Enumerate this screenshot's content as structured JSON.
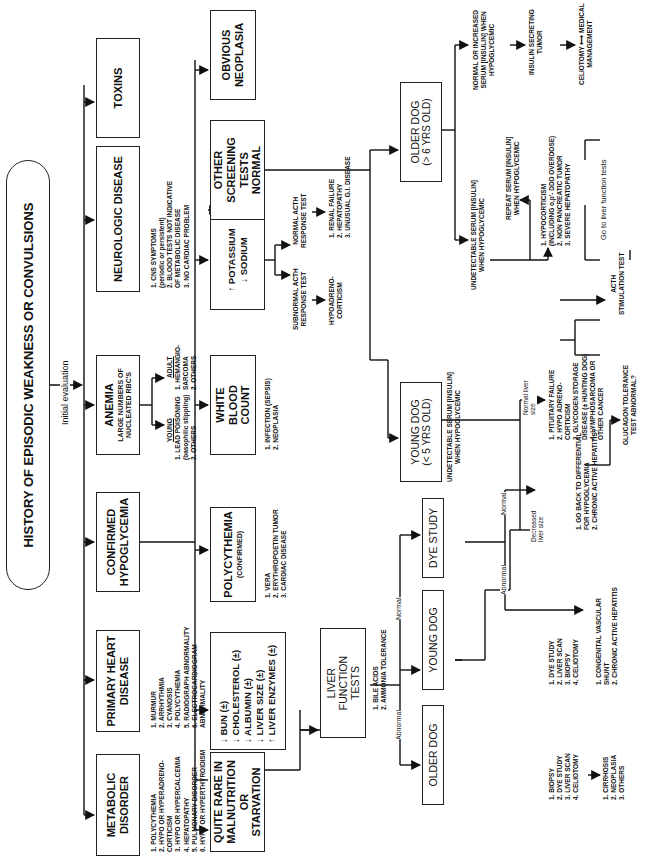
{
  "title": "HISTORY OF EPISODIC WEAKNESS OR CONVULSIONS",
  "initial_label": "Initial  evaluation",
  "row1": {
    "metabolic": {
      "label": "METABOLIC DISORDER",
      "items": [
        "1.  POLYCYTHEMIA",
        "2.  HYPO OR HYPERADRENO-",
        "     CORTICISM",
        "3.  HYPO OR HYPERCALCEMIA",
        "4.  HEPATOPATHY",
        "5.  PULMONARY DISORDER",
        "6.  HYPO OR HYPERTHYROIDISM"
      ]
    },
    "heart": {
      "label": "PRIMARY HEART DISEASE",
      "items": [
        "1.  MURMUR",
        "2.  ARRHYTHMIA",
        "3.  CYANOSIS",
        "4.  POLYCYTHEMIA",
        "5.  RADIOGRAPH ABNORMALITY",
        "6.  ELECTROCARDIOGRAM",
        "     ABNORMALITY"
      ]
    },
    "hypoglycemia": {
      "label": "CONFIRMED HYPOGLYCEMIA"
    },
    "anemia": {
      "label": "ANEMIA",
      "sub": "LARGE NUMBERS OF NUCLEATED RBC'S",
      "young": {
        "heading": "YOUNG",
        "items": [
          "1.  LEAD POISONING",
          "     (basophilic stippling)",
          "2.  OTHERS"
        ]
      },
      "adult": {
        "heading": "ADULT",
        "items": [
          "1.  HEMANGIO-",
          "     SARCOMA",
          "2.  OTHERS"
        ]
      }
    },
    "neurologic": {
      "label": "NEUROLOGIC DISEASE",
      "items": [
        "1.  CNS SYMPTOMS",
        "     (periodic or persistent)",
        "2.  BLOOD TESTS NOT INDICATIVE",
        "     OF METABOLIC DISEASE",
        "3.  NO CARDIAC PROBLEM"
      ],
      "causes": [
        "1.  PRIMARY CNS DISEASE",
        "2.  TRAUMA",
        "3.  NEUROMUSCULAR DISEASE",
        "     (numerous causes)"
      ]
    },
    "toxins": {
      "label": "TOXINS"
    }
  },
  "row2": {
    "starvation": {
      "label": "QUITE RARE IN MALNUTRITION OR STARVATION"
    },
    "liver_signs": {
      "items": [
        "↓  BUN (±)",
        "↓  CHOLESTEROL (±)",
        "↓  ALBUMIN (±)",
        "↓  LIVER SIZE (±)",
        "↑  LIVER ENZYMES (±)"
      ]
    },
    "polycythemia": {
      "label": "POLYCYTHEMIA",
      "sub": "(CONFIRMED)",
      "items": [
        "1.  VERA",
        "2.  ERYTHROPOETIN  TUMOR",
        "3.  CARDIAC DISEASE"
      ]
    },
    "wbc": {
      "label": "WHITE BLOOD COUNT",
      "items": [
        "1.  INFECTION (SEPSIS)",
        "2.  NEOPLASIA"
      ]
    },
    "electrolytes": {
      "label_lines": [
        "↑  POTASSIUM",
        "↓  SODIUM"
      ],
      "subnormal": [
        "SUBNORMAL  ACTH",
        "RESPONSE  TEST"
      ],
      "subnormal_result": [
        "HYPOADRENO-",
        "CORTICISM"
      ],
      "normal": [
        "NORMAL  ACTH",
        "RESPONSE  TEST"
      ],
      "normal_result": [
        "1.  RENAL FAILURE",
        "2.  HEPATOPATHY",
        "3.  UNUSUAL G.I. DISEASE"
      ]
    },
    "screening": {
      "label": "OTHER SCREENING TESTS NORMAL"
    },
    "neoplasia": {
      "label": "OBVIOUS NEOPLASIA"
    }
  },
  "hypoglycemia_branch": {
    "young_dog": {
      "label": "YOUNG DOG",
      "sub": "(< 5 YRS OLD)"
    },
    "older_dog": {
      "label": "OLDER DOG",
      "sub": "(> 6 YRS OLD)"
    },
    "young_undetectable": [
      "UNDETECTABLE  SERUM  [INSULIN]",
      "WHEN HYPOGLYCEMIC"
    ],
    "decreased_liver": [
      "Decreased",
      "liver size"
    ],
    "normal_liver": [
      "Normal liver",
      "size"
    ],
    "normal_liver_items": [
      "1.  PITUITARY FAILURE",
      "2.  HYPO ADRENO-",
      "     CORTICISM",
      "3.  GLYCOGEN  STORAGE",
      "     DISEASE (± HUNTING DOG)",
      "4.  LYMPHOSARCOMA OR",
      "     OTHER CANCER"
    ],
    "acth_test": [
      "ACTH",
      "STIMULATION  TEST"
    ],
    "glucagon_test": [
      "GLUCAGON  TOLERANCE",
      "TEST  ABNORMAL?"
    ],
    "older_undetectable": [
      "UNDETECTABLE SERUM [INSULIN]",
      "WHEN HYPOGLYCEMIC"
    ],
    "older_undetectable_items": [
      "1.  HYPOCORTICISM",
      "     (INCLUDING o,p'- DDD OVERDOSE)",
      "2.  NON PANCREATIC  TUMOR",
      "3.  SEVERE  HEPATOPATHY"
    ],
    "repeat_serum": [
      "REPEAT SERUM [INSULIN]",
      "WHEN HYPOGLYCEMIC"
    ],
    "go_liver": "Go to liver function tests",
    "normal_increased": [
      "NORMAL OR INCREASED",
      "SERUM [INSULIN] WHEN",
      "HYPOGLYCEMIC"
    ],
    "insulin_tumor": [
      "INSULIN SECRETING",
      "TUMOR"
    ],
    "celiotomy": [
      "CELIOTOMY  ⟷  MEDICAL",
      "MANAGEMENT"
    ]
  },
  "liver_branch": {
    "lft": {
      "label": "LIVER  FUNCTION TESTS",
      "items": [
        "1.  BILE ACIDS",
        "2.  AMMONIA TOLERANCE"
      ]
    },
    "abnormal_label": "Abnormal",
    "normal_label": "Normal",
    "older_dog": {
      "label": "OLDER DOG",
      "items": [
        "1.  BIOPSY",
        "2.  DYE STUDY",
        "3.  LIVER SCAN",
        "4.  CELIOTOMY"
      ],
      "results": [
        "1.  CIRRHOSIS",
        "2.  NEOPLASIA",
        "3.  OTHERS"
      ]
    },
    "young_dog": {
      "label": "YOUNG DOG",
      "items": [
        "1.  DYE STUDY",
        "2.  LIVER SCAN",
        "3.  BIOPSY",
        "4.  CELIOTOMY"
      ],
      "results": [
        "1.  CONGENITAL  VASCULAR",
        "     SHUNT",
        "2.  CHRONIC  ACTIVE HEPATITIS"
      ]
    },
    "dye_study": {
      "label": "DYE  STUDY"
    },
    "dye_normal_label": "Normal",
    "dye_abnormal_label": "Abnormal",
    "dye_normal_items": [
      "1.  GO BACK TO DIFFERENTIAL",
      "     FOR HYPOGLYCEMIA",
      "2.  CHRONIC  ACTIVE  HEPATITIS?"
    ]
  }
}
